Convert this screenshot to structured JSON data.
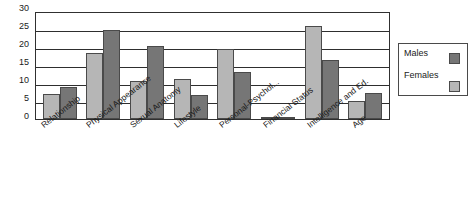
{
  "chart_data": {
    "type": "bar",
    "title": "",
    "subtitle": "",
    "xlabel": "",
    "ylabel": "",
    "ylim": [
      0,
      30
    ],
    "ytick_step": 5,
    "yticks": [
      "30",
      "25",
      "20",
      "15",
      "10",
      "5",
      "0"
    ],
    "grid": true,
    "grid_axis": "y",
    "legend_position": "right",
    "bar_orientation": "vertical",
    "grouping": "grouped",
    "categories": [
      "Relationship",
      "Physical Appearance",
      "Sexual Anatomy",
      "Lifestyle",
      "Personal-Psychol...",
      "Financial Status",
      "Intelligence and Ed.",
      "Age"
    ],
    "series": [
      {
        "name": "Females",
        "color": "#b6b6b6",
        "values": [
          7.0,
          18.3,
          10.5,
          11.1,
          19.5,
          0.3,
          25.8,
          4.9
        ]
      },
      {
        "name": "Males",
        "color": "#767676",
        "values": [
          9.0,
          24.8,
          20.2,
          6.7,
          13.0,
          0.3,
          16.3,
          7.1
        ]
      }
    ]
  },
  "legend": {
    "entries": [
      {
        "label": "Males"
      },
      {
        "label": "Females"
      }
    ]
  },
  "colors": {
    "females_swatch": "#b6b6b6",
    "males_swatch": "#767676",
    "axis_line": "#303030",
    "gridline": "#2e2e2e",
    "background": "#ffffff"
  }
}
